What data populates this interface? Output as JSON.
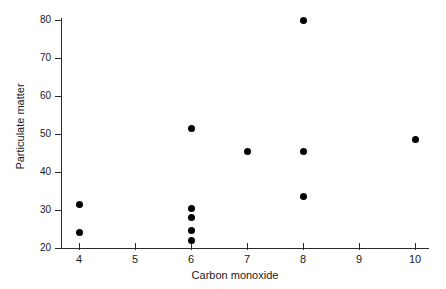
{
  "chart_data": {
    "type": "scatter",
    "title": "",
    "xlabel": "Carbon monoxide",
    "ylabel": "Particulate matter",
    "xlim": [
      4,
      10
    ],
    "ylim": [
      20,
      80
    ],
    "xticks": [
      4,
      5,
      6,
      7,
      8,
      9,
      10
    ],
    "yticks": [
      20,
      30,
      40,
      50,
      60,
      70,
      80
    ],
    "xtick_labels": [
      "4",
      "5",
      "6",
      "7",
      "8",
      "9",
      "10"
    ],
    "ytick_labels": [
      "20",
      "30",
      "40",
      "50",
      "60",
      "70",
      "80"
    ],
    "grid": false,
    "legend": null,
    "marker": "filled-circle",
    "marker_color": "#000000",
    "axis_color": "#2b2b2b",
    "background": "#ffffff",
    "points": [
      {
        "x": 4,
        "y": 31.5
      },
      {
        "x": 4,
        "y": 24.0
      },
      {
        "x": 6,
        "y": 51.5
      },
      {
        "x": 6,
        "y": 30.5
      },
      {
        "x": 6,
        "y": 28.0
      },
      {
        "x": 6,
        "y": 24.5
      },
      {
        "x": 6,
        "y": 22.0
      },
      {
        "x": 7,
        "y": 45.5
      },
      {
        "x": 8,
        "y": 80.0
      },
      {
        "x": 8,
        "y": 45.5
      },
      {
        "x": 8,
        "y": 33.5
      },
      {
        "x": 10,
        "y": 48.5
      }
    ]
  }
}
